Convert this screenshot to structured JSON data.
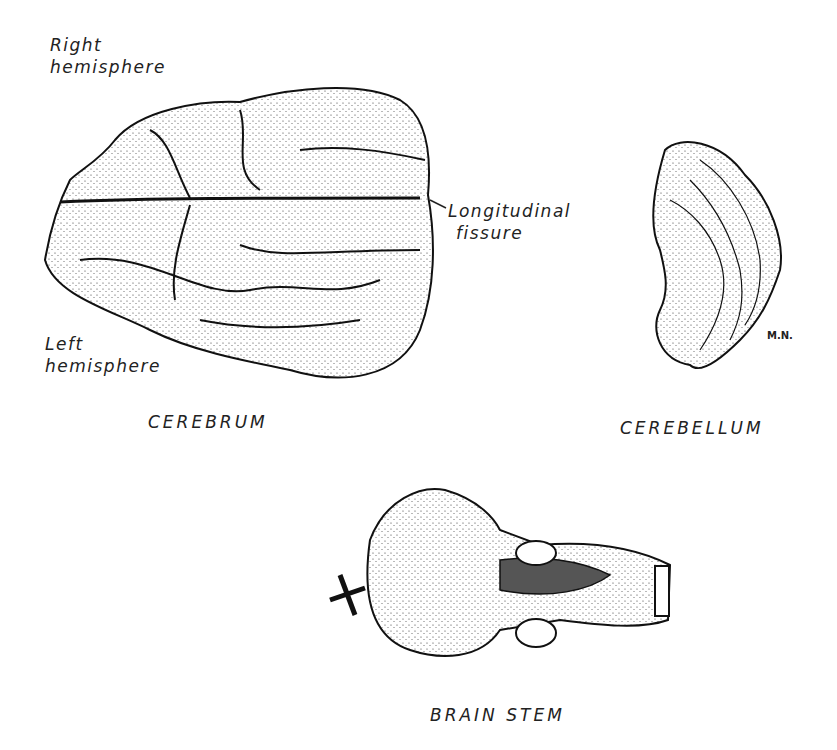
{
  "figure": {
    "cerebrum": {
      "caption": "CEREBRUM",
      "labels": {
        "right_hemisphere_1": "Right",
        "right_hemisphere_2": "hemisphere",
        "left_hemisphere_1": "Left",
        "left_hemisphere_2": "hemisphere",
        "fissure_1": "Longitudinal",
        "fissure_2": "fissure"
      }
    },
    "cerebellum": {
      "caption": "CEREBELLUM",
      "signature": "M.N."
    },
    "brain_stem": {
      "caption": "BRAIN STEM"
    }
  }
}
